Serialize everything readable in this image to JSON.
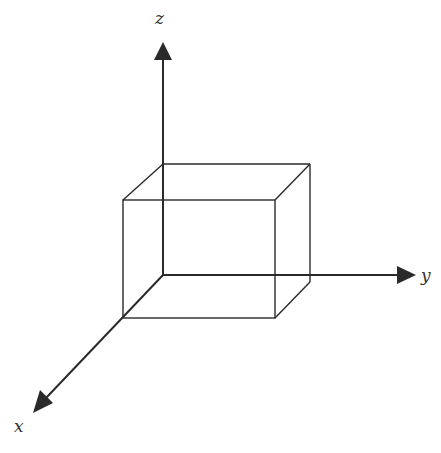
{
  "diagram": {
    "type": "3d-coordinate-axes-with-box",
    "axes": {
      "z": {
        "label": "z",
        "origin": [
          163,
          275
        ],
        "tip": [
          163,
          42
        ],
        "label_pos": [
          155,
          24
        ]
      },
      "y": {
        "label": "y",
        "origin": [
          163,
          275
        ],
        "tip": [
          415,
          275
        ],
        "label_pos": [
          421,
          281
        ]
      },
      "x": {
        "label": "x",
        "origin": [
          163,
          275
        ],
        "tip": [
          33,
          412
        ],
        "label_pos": [
          14,
          432
        ]
      }
    },
    "box": {
      "back_face": {
        "x1": 163,
        "y1": 164,
        "x2": 310,
        "y2": 275
      },
      "front_face": {
        "x1": 123,
        "y1": 200,
        "x2": 275,
        "y2": 318
      }
    },
    "colors": {
      "stroke": "#2a2a2a",
      "background": "#ffffff"
    }
  }
}
